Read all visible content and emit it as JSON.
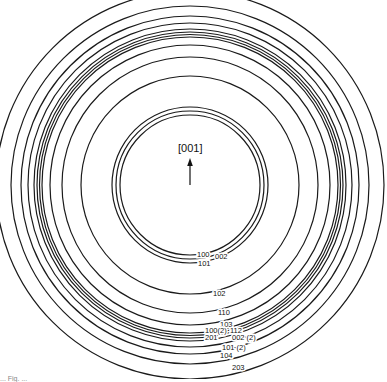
{
  "figure": {
    "center": {
      "x": 190,
      "y": 185
    },
    "direction_label": "[001]",
    "caption_fragment": "... Fig. ...",
    "stroke_color": "#1a1a1a",
    "background": "#ffffff"
  },
  "rings": [
    {
      "r": 70,
      "label": "100"
    },
    {
      "r": 74,
      "label": "002"
    },
    {
      "r": 78,
      "label": "101"
    },
    {
      "r": 109,
      "label": "102"
    },
    {
      "r": 128,
      "label": "110"
    },
    {
      "r": 140,
      "label": "103"
    },
    {
      "r": 148,
      "label": "100(2)"
    },
    {
      "r": 150.5,
      "label": "112"
    },
    {
      "r": 153,
      "label": "201"
    },
    {
      "r": 156,
      "label": "002 (2)"
    },
    {
      "r": 162,
      "label": "101 (2)"
    },
    {
      "r": 169,
      "label": "104"
    },
    {
      "r": 179,
      "label": "203"
    },
    {
      "r": 194,
      "label": ""
    }
  ],
  "labels": [
    {
      "text": "100",
      "x": 197,
      "y": 257
    },
    {
      "text": "002",
      "x": 215,
      "y": 259
    },
    {
      "text": "101",
      "x": 198,
      "y": 266
    },
    {
      "text": "102",
      "x": 213,
      "y": 296
    },
    {
      "text": "110",
      "x": 218,
      "y": 315
    },
    {
      "text": "103",
      "x": 220,
      "y": 327
    },
    {
      "text": "100(2)",
      "x": 205,
      "y": 333
    },
    {
      "text": "112",
      "x": 230,
      "y": 333
    },
    {
      "text": "201",
      "x": 205,
      "y": 340
    },
    {
      "text": "002 (2)",
      "x": 232,
      "y": 340
    },
    {
      "text": "101 (2)",
      "x": 222,
      "y": 350
    },
    {
      "text": "104",
      "x": 220,
      "y": 358
    },
    {
      "text": "203",
      "x": 232,
      "y": 370
    }
  ]
}
